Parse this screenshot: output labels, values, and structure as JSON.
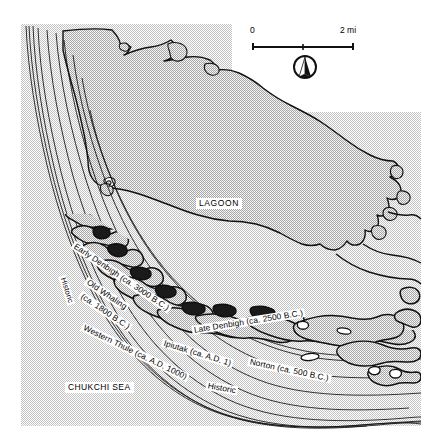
{
  "map": {
    "title_region": "Cape Krusenstern beach ridge map",
    "water_labels": [
      {
        "name": "lagoon-label",
        "text": "LAGOON",
        "x": 196,
        "y": 198
      },
      {
        "name": "chukchi-sea-label",
        "text": "CHUKCHI SEA",
        "x": 65,
        "y": 382
      }
    ],
    "scale_bar": {
      "left_label": "0",
      "right_label": "2 mi",
      "x": 253,
      "y": 38,
      "width": 100
    },
    "north_arrow": {
      "icon": "north-arrow-icon",
      "x": 305,
      "y": 67,
      "radius": 11
    },
    "ridge_labels": [
      {
        "name": "ridge-label-historic-upper",
        "text": "Historic",
        "x": 62,
        "y": 272,
        "rotate": 72,
        "size": 7.6
      },
      {
        "name": "ridge-label-early-denbigh",
        "text": "Early Denbigh (ca. 3000 B.C.)",
        "x": 73,
        "y": 240,
        "rotate": 34,
        "size": 8.3
      },
      {
        "name": "ridge-label-old-whaling",
        "text": "Old Whaling",
        "x": 86,
        "y": 276,
        "rotate": 34,
        "size": 8.3
      },
      {
        "name": "ridge-label-old-whaling-date",
        "text": "(ca. 1800 B.C.)",
        "x": 80,
        "y": 288,
        "rotate": 34,
        "size": 8.3
      },
      {
        "name": "ridge-label-western-thule",
        "text": "Western Thule (ca. A.D. 1000)",
        "x": 82,
        "y": 320,
        "rotate": 26,
        "size": 8.3
      },
      {
        "name": "ridge-label-ipiutak",
        "text": "Ipiutak (ca. A.D. 1)",
        "x": 162,
        "y": 337,
        "rotate": 17,
        "size": 8.3
      },
      {
        "name": "ridge-label-late-denbigh",
        "text": "Late Denbigh (ca. 2500 B.C.)",
        "x": 192,
        "y": 325,
        "rotate": -9,
        "size": 8.3
      },
      {
        "name": "ridge-label-norton",
        "text": "Norton (ca. 500 B.C.)",
        "x": 248,
        "y": 358,
        "rotate": 12,
        "size": 8.3
      },
      {
        "name": "ridge-label-historic-lower",
        "text": "Historic",
        "x": 206,
        "y": 381,
        "rotate": 10,
        "size": 8.3
      }
    ],
    "colors": {
      "outline": "#111111",
      "stipple_light": "#d0d0d0",
      "stipple_lagoon": "#b9b9b9",
      "white": "#ffffff",
      "label_background": "#ffffff"
    }
  }
}
